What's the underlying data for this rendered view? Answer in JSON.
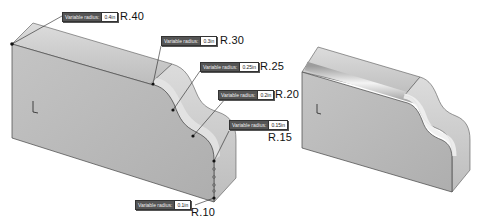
{
  "figure": {
    "left_model": {
      "name": "variable-radius-fillet-preview",
      "callouts": [
        {
          "label": "Variable radius:",
          "value": "0.4in",
          "radius_label": "R.40"
        },
        {
          "label": "Variable radius:",
          "value": "0.3in",
          "radius_label": "R.30"
        },
        {
          "label": "Variable radius:",
          "value": "0.25in",
          "radius_label": "R.25"
        },
        {
          "label": "Variable radius:",
          "value": "0.2in",
          "radius_label": "R.20"
        },
        {
          "label": "Variable radius:",
          "value": "0.15in",
          "radius_label": "R.15"
        },
        {
          "label": "Variable radius:",
          "value": "0.1in",
          "radius_label": "R.10"
        }
      ]
    },
    "right_model": {
      "name": "filleted-result"
    },
    "colors": {
      "face": "#b9b9b9",
      "face_light": "#d6d6d6",
      "edge": "#444444",
      "background": "#ffffff"
    }
  }
}
